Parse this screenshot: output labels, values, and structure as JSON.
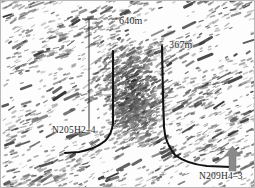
{
  "figure": {
    "background_description": "seismic-attribute-texture",
    "frame_color": "#b9b9b9"
  },
  "annotations": {
    "distance_640": "640m",
    "distance_367": "367m",
    "well_left_label": "N205H2–4",
    "well_right_label": "N209H4–3"
  },
  "north_arrow": {
    "name": "north-arrow",
    "color": "#8a8a8a",
    "direction": "up"
  },
  "chart_data": {
    "type": "scatter",
    "xlabel": "",
    "ylabel": "",
    "annotations": [
      {
        "text": "640m",
        "x": 118,
        "y": 14,
        "kind": "distance-measure"
      },
      {
        "text": "367m",
        "x": 168,
        "y": 38,
        "kind": "distance-measure"
      },
      {
        "text": "N205H2–4",
        "x": 51,
        "y": 124,
        "kind": "well-name"
      },
      {
        "text": "N209H4–3",
        "x": 198,
        "y": 170,
        "kind": "well-name"
      }
    ],
    "measure_lines": [
      {
        "label": "640m",
        "x": 88,
        "y_top": 18,
        "y_bottom": 130,
        "tick_width": 14
      },
      {
        "label": "367m",
        "x": 161,
        "y_top": 45,
        "y_bottom": 132,
        "tick_width": 0
      }
    ],
    "wells": [
      {
        "name": "N205H2–4",
        "color": "#111111",
        "path": [
          [
            76,
            134
          ],
          [
            80,
            140
          ],
          [
            88,
            146
          ],
          [
            100,
            150
          ],
          [
            118,
            152
          ],
          [
            140,
            153
          ],
          [
            160,
            153
          ]
        ]
      },
      {
        "name": "N209H4–3",
        "color": "#111111",
        "path": [
          [
            161,
            45
          ],
          [
            162,
            90
          ],
          [
            163,
            120
          ],
          [
            164,
            135
          ],
          [
            168,
            148
          ],
          [
            178,
            158
          ],
          [
            192,
            163
          ],
          [
            210,
            165
          ],
          [
            228,
            166
          ]
        ]
      },
      {
        "name": "N205H2–4-vertical",
        "color": "#111111",
        "path": [
          [
            112,
            50
          ],
          [
            112,
            90
          ],
          [
            112,
            120
          ],
          [
            110,
            132
          ],
          [
            104,
            140
          ],
          [
            94,
            146
          ],
          [
            80,
            150
          ],
          [
            66,
            152
          ]
        ]
      }
    ],
    "event_cloud": {
      "legend": "microseismic events",
      "color": "#4a4a4a",
      "count": 900,
      "bbox": [
        96,
        42,
        166,
        140
      ],
      "centroid": [
        130,
        88
      ]
    },
    "grid": false,
    "legend_position": "none"
  }
}
